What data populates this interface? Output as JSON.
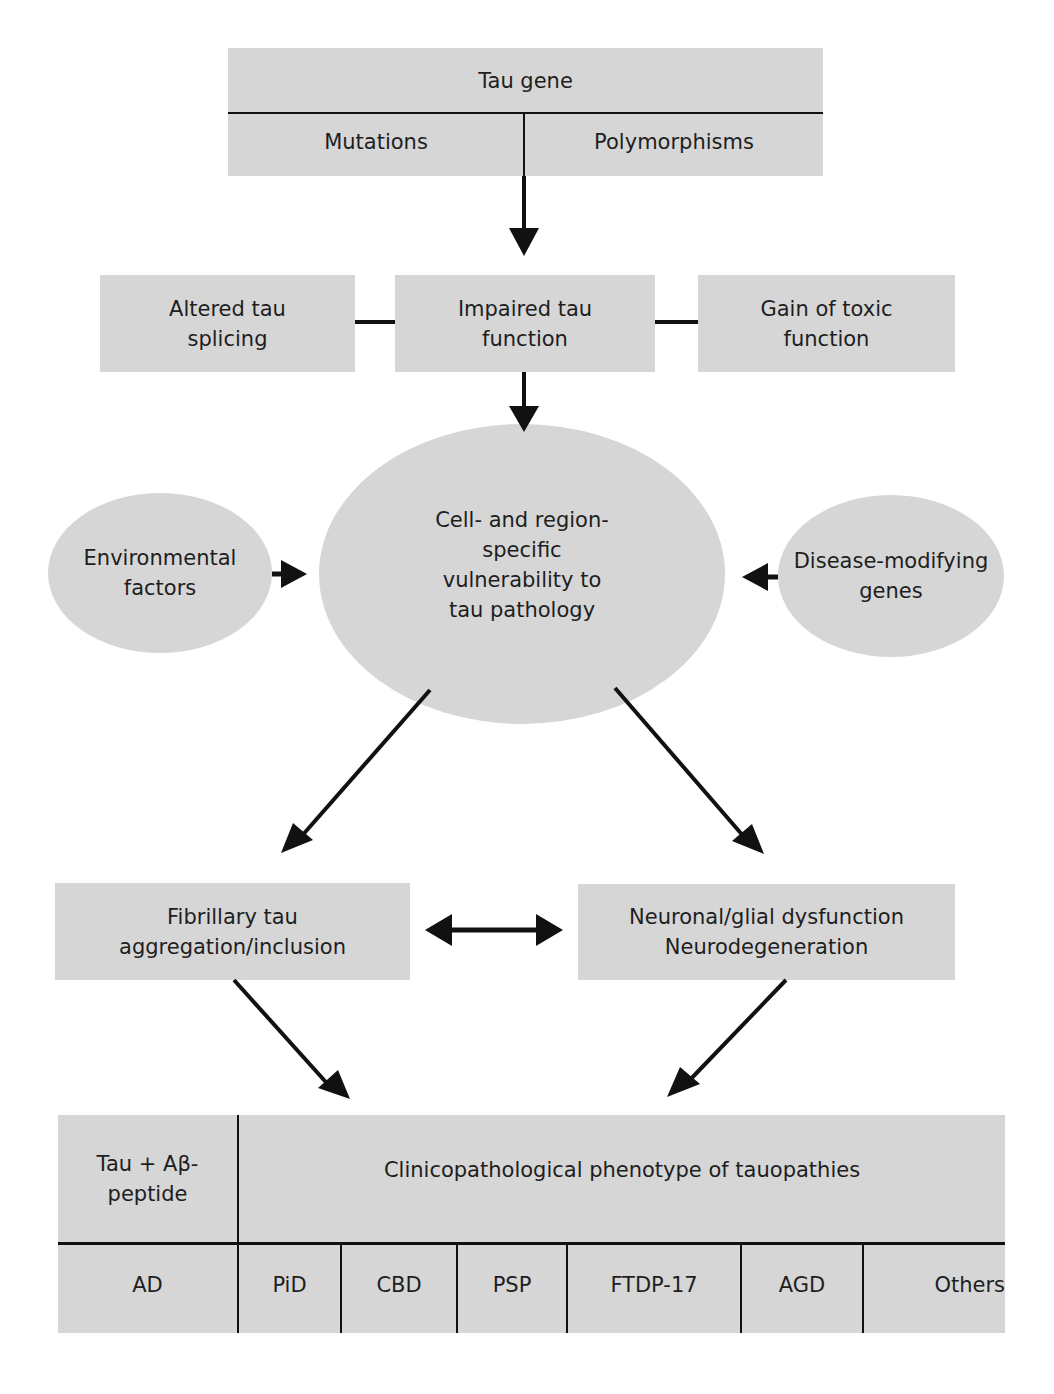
{
  "diagram": {
    "tau_gene": {
      "title": "Tau gene",
      "left": "Mutations",
      "right": "Polymorphisms"
    },
    "row2": {
      "left": [
        "Altered tau",
        "splicing"
      ],
      "center": [
        "Impaired tau",
        "function"
      ],
      "right": [
        "Gain of toxic",
        "function"
      ]
    },
    "row3": {
      "left": [
        "Environmental",
        "factors"
      ],
      "center": [
        "Cell- and region-",
        "specific",
        "vulnerability to",
        "tau pathology"
      ],
      "right": [
        "Disease-modifying",
        "genes"
      ]
    },
    "row4": {
      "left": [
        "Fibrillary tau",
        "aggregation/inclusion"
      ],
      "right": [
        "Neuronal/glial dysfunction",
        "Neurodegeneration"
      ]
    },
    "table": {
      "left_header": [
        "Tau + Aβ-",
        "peptide"
      ],
      "right_header": "Clinicopathological phenotype of tauopathies",
      "cells": [
        "AD",
        "PiD",
        "CBD",
        "PSP",
        "FTDP-17",
        "AGD",
        "Others"
      ]
    },
    "colors": {
      "fill": "#d6d6d6",
      "line": "#111111",
      "text": "#1e1e1e"
    }
  }
}
